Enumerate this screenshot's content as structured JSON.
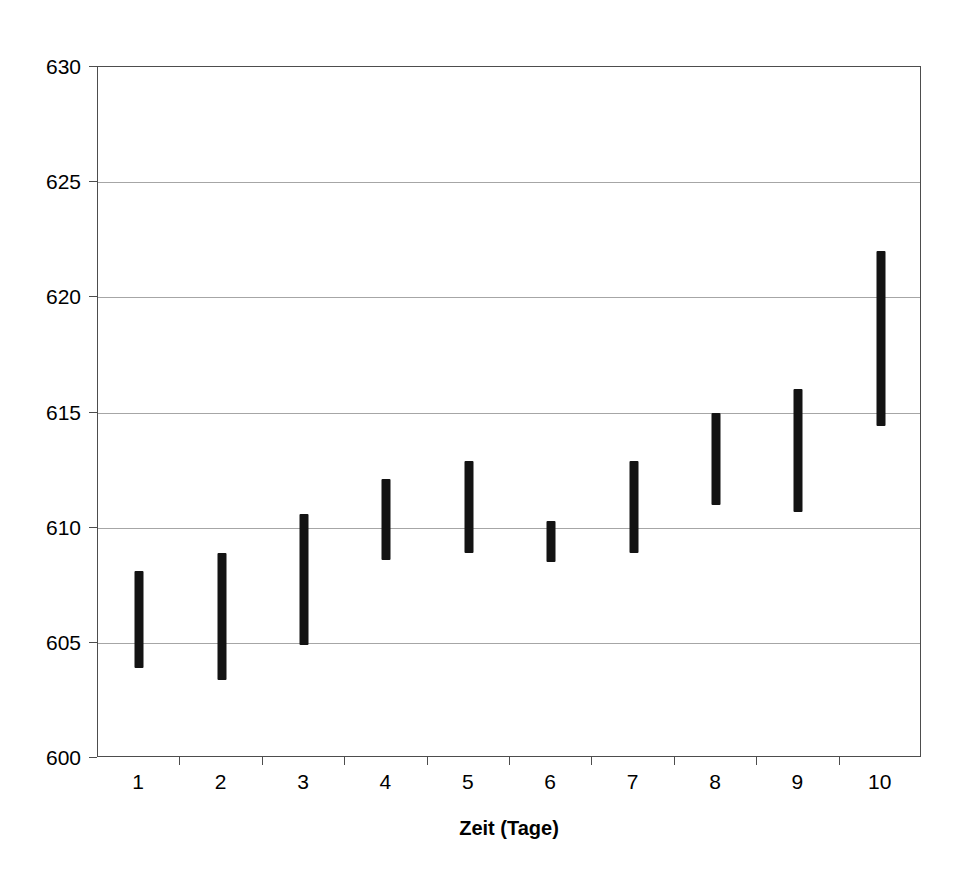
{
  "chart_data": {
    "type": "bar",
    "subtype": "high-low-range",
    "title": "",
    "subtitle": "",
    "xlabel": "Zeit (Tage)",
    "ylabel": "",
    "categories": [
      "1",
      "2",
      "3",
      "4",
      "5",
      "6",
      "7",
      "8",
      "9",
      "10"
    ],
    "x": [
      1,
      2,
      3,
      4,
      5,
      6,
      7,
      8,
      9,
      10
    ],
    "series": [
      {
        "name": "low",
        "values": [
          603.9,
          603.4,
          604.9,
          608.6,
          608.9,
          608.5,
          608.9,
          611.0,
          610.7,
          614.4
        ]
      },
      {
        "name": "high",
        "values": [
          608.1,
          608.9,
          610.6,
          612.1,
          612.9,
          610.3,
          612.9,
          615.0,
          616.0,
          622.0
        ]
      }
    ],
    "ylim": [
      600,
      630
    ],
    "xlim": [
      0.5,
      10.5
    ],
    "y_ticks": [
      600,
      605,
      610,
      615,
      620,
      625,
      630
    ],
    "y_tick_labels": [
      "600",
      "605",
      "610",
      "615",
      "620",
      "625",
      "630"
    ],
    "x_ticks": [
      1,
      2,
      3,
      4,
      5,
      6,
      7,
      8,
      9,
      10
    ],
    "x_tick_labels": [
      "1",
      "2",
      "3",
      "4",
      "5",
      "6",
      "7",
      "8",
      "9",
      "10"
    ],
    "grid": "horizontal",
    "legend": "none",
    "annotations": [],
    "colors": {
      "bar": "#131313",
      "gridline": "#a6a6a6",
      "axis": "#4d4d4d",
      "background": "#ffffff",
      "text": "#000000"
    }
  }
}
